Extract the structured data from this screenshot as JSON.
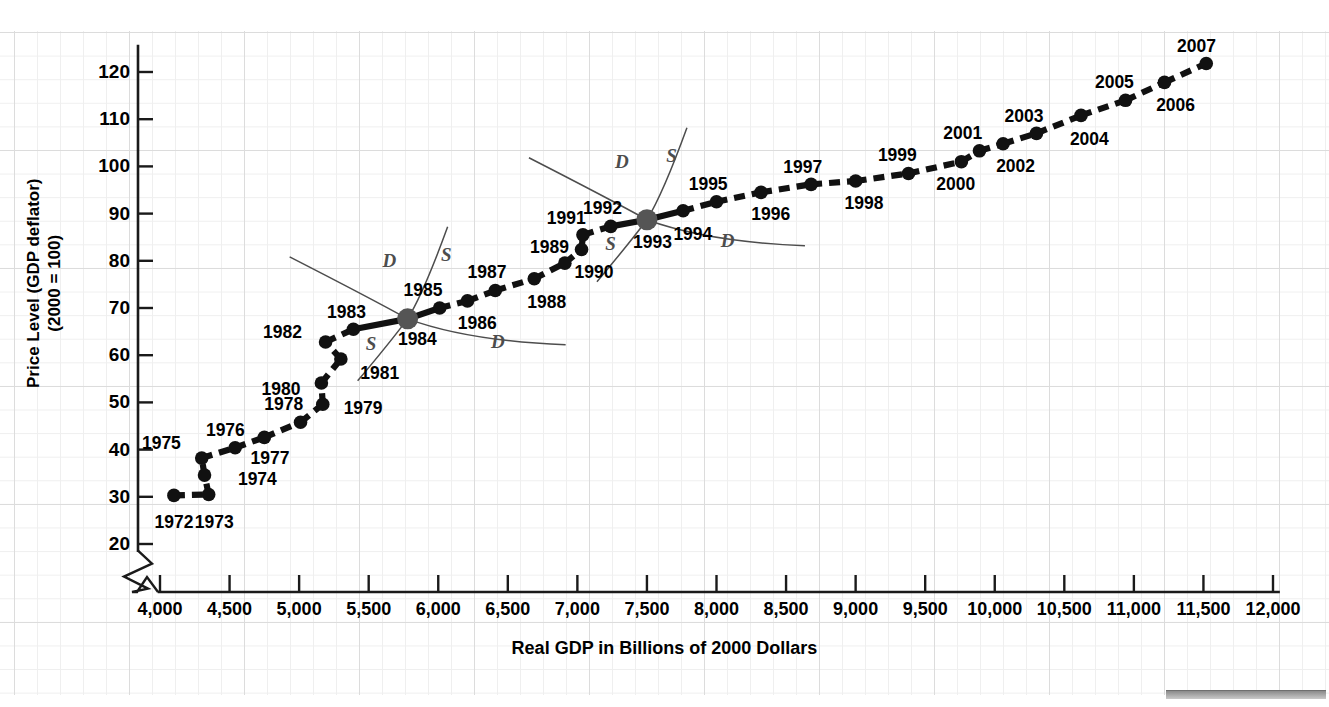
{
  "chart_data": {
    "type": "scatter",
    "title": "",
    "xlabel": "Real GDP in Billions of 2000 Dollars",
    "ylabel": "Price Level (GDP deflator)\n(2000 = 100)",
    "xlim": [
      3800,
      12100
    ],
    "ylim": [
      17,
      126
    ],
    "xticks": [
      "4,000",
      "4,500",
      "5,000",
      "5,500",
      "6,000",
      "6,500",
      "7,000",
      "7,500",
      "8,000",
      "8,500",
      "9,000",
      "9,500",
      "10,000",
      "10,500",
      "11,000",
      "11,500",
      "12,000"
    ],
    "xtick_values": [
      4000,
      4500,
      5000,
      5500,
      6000,
      6500,
      7000,
      7500,
      8000,
      8500,
      9000,
      9500,
      10000,
      10500,
      11000,
      11500,
      12000
    ],
    "yticks": [
      "20",
      "30",
      "40",
      "50",
      "60",
      "70",
      "80",
      "90",
      "100",
      "110",
      "120"
    ],
    "ytick_values": [
      20,
      30,
      40,
      50,
      60,
      70,
      80,
      90,
      100,
      110,
      120
    ],
    "grid": true,
    "legend": "none",
    "axis_break_x": true,
    "axis_break_y": true,
    "series_name": "U.S. Aggregate Demand and Supply Equilibria 1972-2007",
    "points": [
      {
        "label": "1972",
        "x": 4100,
        "y": 30.3,
        "lx": 4100,
        "ly": 24.5,
        "anchor": "middle"
      },
      {
        "label": "1973",
        "x": 4350,
        "y": 30.5,
        "lx": 4390,
        "ly": 24.5,
        "anchor": "middle"
      },
      {
        "label": "1974",
        "x": 4320,
        "y": 34.6,
        "lx": 4560,
        "ly": 33.6,
        "anchor": "start"
      },
      {
        "label": "1975",
        "x": 4300,
        "y": 38.2,
        "lx": 4150,
        "ly": 41.2,
        "anchor": "end"
      },
      {
        "label": "1976",
        "x": 4540,
        "y": 40.4,
        "lx": 4470,
        "ly": 44.0,
        "anchor": "middle"
      },
      {
        "label": "1977",
        "x": 4750,
        "y": 42.6,
        "lx": 4790,
        "ly": 38.1,
        "anchor": "middle"
      },
      {
        "label": "1978",
        "x": 5010,
        "y": 45.8,
        "lx": 4890,
        "ly": 49.4,
        "anchor": "middle"
      },
      {
        "label": "1979",
        "x": 5170,
        "y": 49.6,
        "lx": 5320,
        "ly": 48.6,
        "anchor": "start"
      },
      {
        "label": "1980",
        "x": 5160,
        "y": 54.1,
        "lx": 5010,
        "ly": 52.6,
        "anchor": "end"
      },
      {
        "label": "1981",
        "x": 5300,
        "y": 59.2,
        "lx": 5440,
        "ly": 56.0,
        "anchor": "start"
      },
      {
        "label": "1982",
        "x": 5190,
        "y": 62.8,
        "lx": 5020,
        "ly": 64.8,
        "anchor": "end"
      },
      {
        "label": "1983",
        "x": 5390,
        "y": 65.5,
        "lx": 5340,
        "ly": 69.0,
        "anchor": "middle"
      },
      {
        "label": "1984",
        "x": 5780,
        "y": 67.7,
        "lx": 5850,
        "ly": 63.2,
        "anchor": "middle",
        "big": true
      },
      {
        "label": "1985",
        "x": 6010,
        "y": 70.0,
        "lx": 5890,
        "ly": 73.5,
        "anchor": "middle"
      },
      {
        "label": "1986",
        "x": 6210,
        "y": 71.5,
        "lx": 6280,
        "ly": 66.6,
        "anchor": "middle"
      },
      {
        "label": "1987",
        "x": 6410,
        "y": 73.7,
        "lx": 6350,
        "ly": 77.4,
        "anchor": "middle"
      },
      {
        "label": "1988",
        "x": 6690,
        "y": 76.2,
        "lx": 6780,
        "ly": 71.1,
        "anchor": "middle"
      },
      {
        "label": "1989",
        "x": 6910,
        "y": 79.5,
        "lx": 6800,
        "ly": 82.7,
        "anchor": "middle"
      },
      {
        "label": "1990",
        "x": 7030,
        "y": 82.4,
        "lx": 7120,
        "ly": 77.5,
        "anchor": "middle"
      },
      {
        "label": "1991",
        "x": 7040,
        "y": 85.5,
        "lx": 6920,
        "ly": 88.8,
        "anchor": "middle"
      },
      {
        "label": "1992",
        "x": 7240,
        "y": 87.3,
        "lx": 7180,
        "ly": 91.0,
        "anchor": "middle"
      },
      {
        "label": "1993",
        "x": 7500,
        "y": 88.7,
        "lx": 7540,
        "ly": 83.7,
        "anchor": "middle",
        "big": true
      },
      {
        "label": "1994",
        "x": 7760,
        "y": 90.6,
        "lx": 7830,
        "ly": 85.4,
        "anchor": "middle"
      },
      {
        "label": "1995",
        "x": 8000,
        "y": 92.5,
        "lx": 7940,
        "ly": 96.1,
        "anchor": "middle"
      },
      {
        "label": "1996",
        "x": 8320,
        "y": 94.5,
        "lx": 8390,
        "ly": 89.6,
        "anchor": "middle"
      },
      {
        "label": "1997",
        "x": 8680,
        "y": 96.2,
        "lx": 8620,
        "ly": 99.7,
        "anchor": "middle"
      },
      {
        "label": "1998",
        "x": 9000,
        "y": 96.9,
        "lx": 9060,
        "ly": 92.0,
        "anchor": "middle"
      },
      {
        "label": "1999",
        "x": 9380,
        "y": 98.5,
        "lx": 9300,
        "ly": 102.1,
        "anchor": "middle"
      },
      {
        "label": "2000",
        "x": 9760,
        "y": 101.0,
        "lx": 9720,
        "ly": 96.0,
        "anchor": "middle"
      },
      {
        "label": "2001",
        "x": 9890,
        "y": 103.3,
        "lx": 9770,
        "ly": 106.8,
        "anchor": "middle"
      },
      {
        "label": "2002",
        "x": 10060,
        "y": 104.8,
        "lx": 10150,
        "ly": 99.8,
        "anchor": "middle"
      },
      {
        "label": "2003",
        "x": 10300,
        "y": 107.0,
        "lx": 10210,
        "ly": 110.5,
        "anchor": "middle"
      },
      {
        "label": "2004",
        "x": 10620,
        "y": 110.8,
        "lx": 10680,
        "ly": 105.6,
        "anchor": "middle"
      },
      {
        "label": "2005",
        "x": 10940,
        "y": 114.0,
        "lx": 10860,
        "ly": 117.6,
        "anchor": "middle"
      },
      {
        "label": "2006",
        "x": 11220,
        "y": 117.8,
        "lx": 11300,
        "ly": 112.7,
        "anchor": "middle"
      },
      {
        "label": "2007",
        "x": 11520,
        "y": 121.8,
        "lx": 11450,
        "ly": 125.3,
        "anchor": "middle"
      }
    ],
    "curve_annotations": [
      {
        "label": "D",
        "at_point": "1984",
        "lx": 5650,
        "ly": 79.9,
        "kind": "demand-upper"
      },
      {
        "label": "S",
        "at_point": "1984",
        "lx": 6070,
        "ly": 81.3,
        "kind": "supply-upper"
      },
      {
        "label": "S",
        "at_point": "1984",
        "lx": 5530,
        "ly": 62.4,
        "kind": "supply-lower"
      },
      {
        "label": "D",
        "at_point": "1984",
        "lx": 6430,
        "ly": 62.8,
        "kind": "demand-lower"
      },
      {
        "label": "D",
        "at_point": "1993",
        "lx": 7320,
        "ly": 100.9,
        "kind": "demand-upper"
      },
      {
        "label": "S",
        "at_point": "1993",
        "lx": 7690,
        "ly": 102.2,
        "kind": "supply-upper"
      },
      {
        "label": "S",
        "at_point": "1993",
        "lx": 7250,
        "ly": 83.6,
        "kind": "supply-lower"
      },
      {
        "label": "D",
        "at_point": "1993",
        "lx": 8080,
        "ly": 84.1,
        "kind": "demand-lower"
      }
    ]
  },
  "colors": {
    "line": "#111111",
    "marker": "#111111",
    "marker_highlight": "#555555",
    "axis": "#1a1a1a",
    "grid_minor": "#efefef",
    "grid_major": "#dcdcdc",
    "annotation": "#4d4d4d"
  }
}
